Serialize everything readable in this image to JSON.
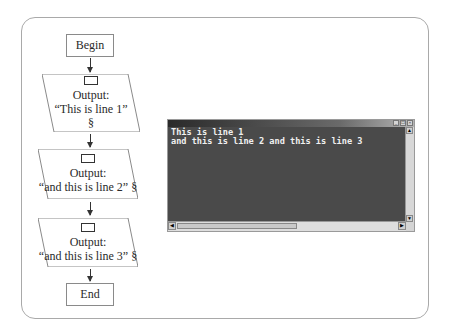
{
  "flowchart": {
    "begin_label": "Begin",
    "end_label": "End",
    "steps": [
      {
        "type": "output",
        "label": "Output:",
        "text": "“This is line 1”",
        "newline_marker": "§",
        "icon": "output-icon"
      },
      {
        "type": "output",
        "label": "Output:",
        "text": "“and this is line 2” §",
        "icon": "output-icon"
      },
      {
        "type": "output",
        "label": "Output:",
        "text": "“and this is line 3” §",
        "icon": "output-icon"
      }
    ]
  },
  "console": {
    "lines": [
      "This is line 1",
      "and this is line 2 and this is line 3"
    ],
    "title_buttons": [
      "minimize",
      "maximize",
      "close"
    ],
    "colors": {
      "background": "#4a4a4a",
      "text": "#f0f0f0"
    }
  }
}
